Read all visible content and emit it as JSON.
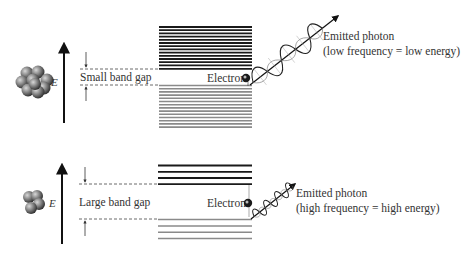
{
  "colors": {
    "background": "#ffffff",
    "text": "#333333",
    "conduction_band": "#1a1a1a",
    "valence_band": "#8a8a8a",
    "atom_fill": "#707070",
    "electron": "#222222"
  },
  "panels": [
    {
      "id": "small-gap",
      "energy_axis_label": "E",
      "band_gap_label": "Small band gap",
      "electron_label": "Electron",
      "photon_label_line1": "Emitted photon",
      "photon_label_line2": "(low frequency = low energy)",
      "upper_band_line_count": 14,
      "lower_band_line_count": 14,
      "atom_count": 9,
      "photon_wave_periods": 3
    },
    {
      "id": "large-gap",
      "energy_axis_label": "E",
      "band_gap_label": "Large band gap",
      "electron_label": "Electron",
      "photon_label_line1": "Emitted photon",
      "photon_label_line2": "(high frequency = high energy)",
      "upper_band_line_count": 4,
      "lower_band_line_count": 4,
      "atom_count": 4,
      "photon_wave_periods": 4
    }
  ]
}
